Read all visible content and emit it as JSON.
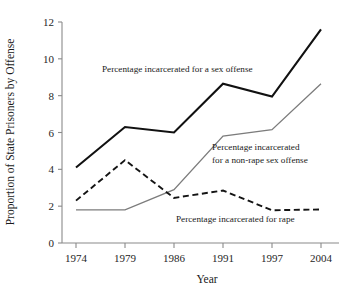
{
  "chart_data": {
    "type": "line",
    "title": "",
    "xlabel": "Year",
    "ylabel": "Proportion of State Prisoners by Offense",
    "categories": [
      "1974",
      "1979",
      "1986",
      "1991",
      "1997",
      "2004"
    ],
    "x": [
      1974,
      1979,
      1986,
      1991,
      1997,
      2004
    ],
    "ylim": [
      0,
      12
    ],
    "yticks": [
      0,
      2,
      4,
      6,
      8,
      10,
      12
    ],
    "ytick_labels": [
      "0",
      "2",
      "4",
      "6",
      "8",
      "10",
      "12"
    ],
    "grid": false,
    "legend_position": "inline-annotations",
    "series": [
      {
        "name": "Percentage incarcerated for a sex offense",
        "values": [
          4.1,
          6.3,
          6.0,
          8.65,
          7.95,
          11.6
        ],
        "color": "#111111",
        "style": "solid",
        "width": 2.1
      },
      {
        "name": "Percentage incarcerated for a non-rape sex offense",
        "values": [
          1.8,
          1.8,
          2.9,
          5.8,
          6.15,
          8.65
        ],
        "color": "#7c7c7c",
        "style": "solid",
        "width": 1.3
      },
      {
        "name": "Percentage incarcerated for rape",
        "values": [
          2.3,
          4.5,
          2.45,
          2.85,
          1.78,
          1.82
        ],
        "color": "#141414",
        "style": "dashed",
        "width": 1.9
      }
    ],
    "annotations": [
      {
        "id": "sex-offense",
        "lines": [
          "Percentage incarcerated for a sex offense"
        ],
        "x": 102,
        "y": 72
      },
      {
        "id": "non-rape-sex-offense",
        "lines": [
          "Percentage incarcerated",
          "for a non-rape sex offense"
        ],
        "x": 212,
        "y": 150
      },
      {
        "id": "rape",
        "lines": [
          "Percentage incarcerated for rape"
        ],
        "x": 176,
        "y": 222
      }
    ]
  }
}
